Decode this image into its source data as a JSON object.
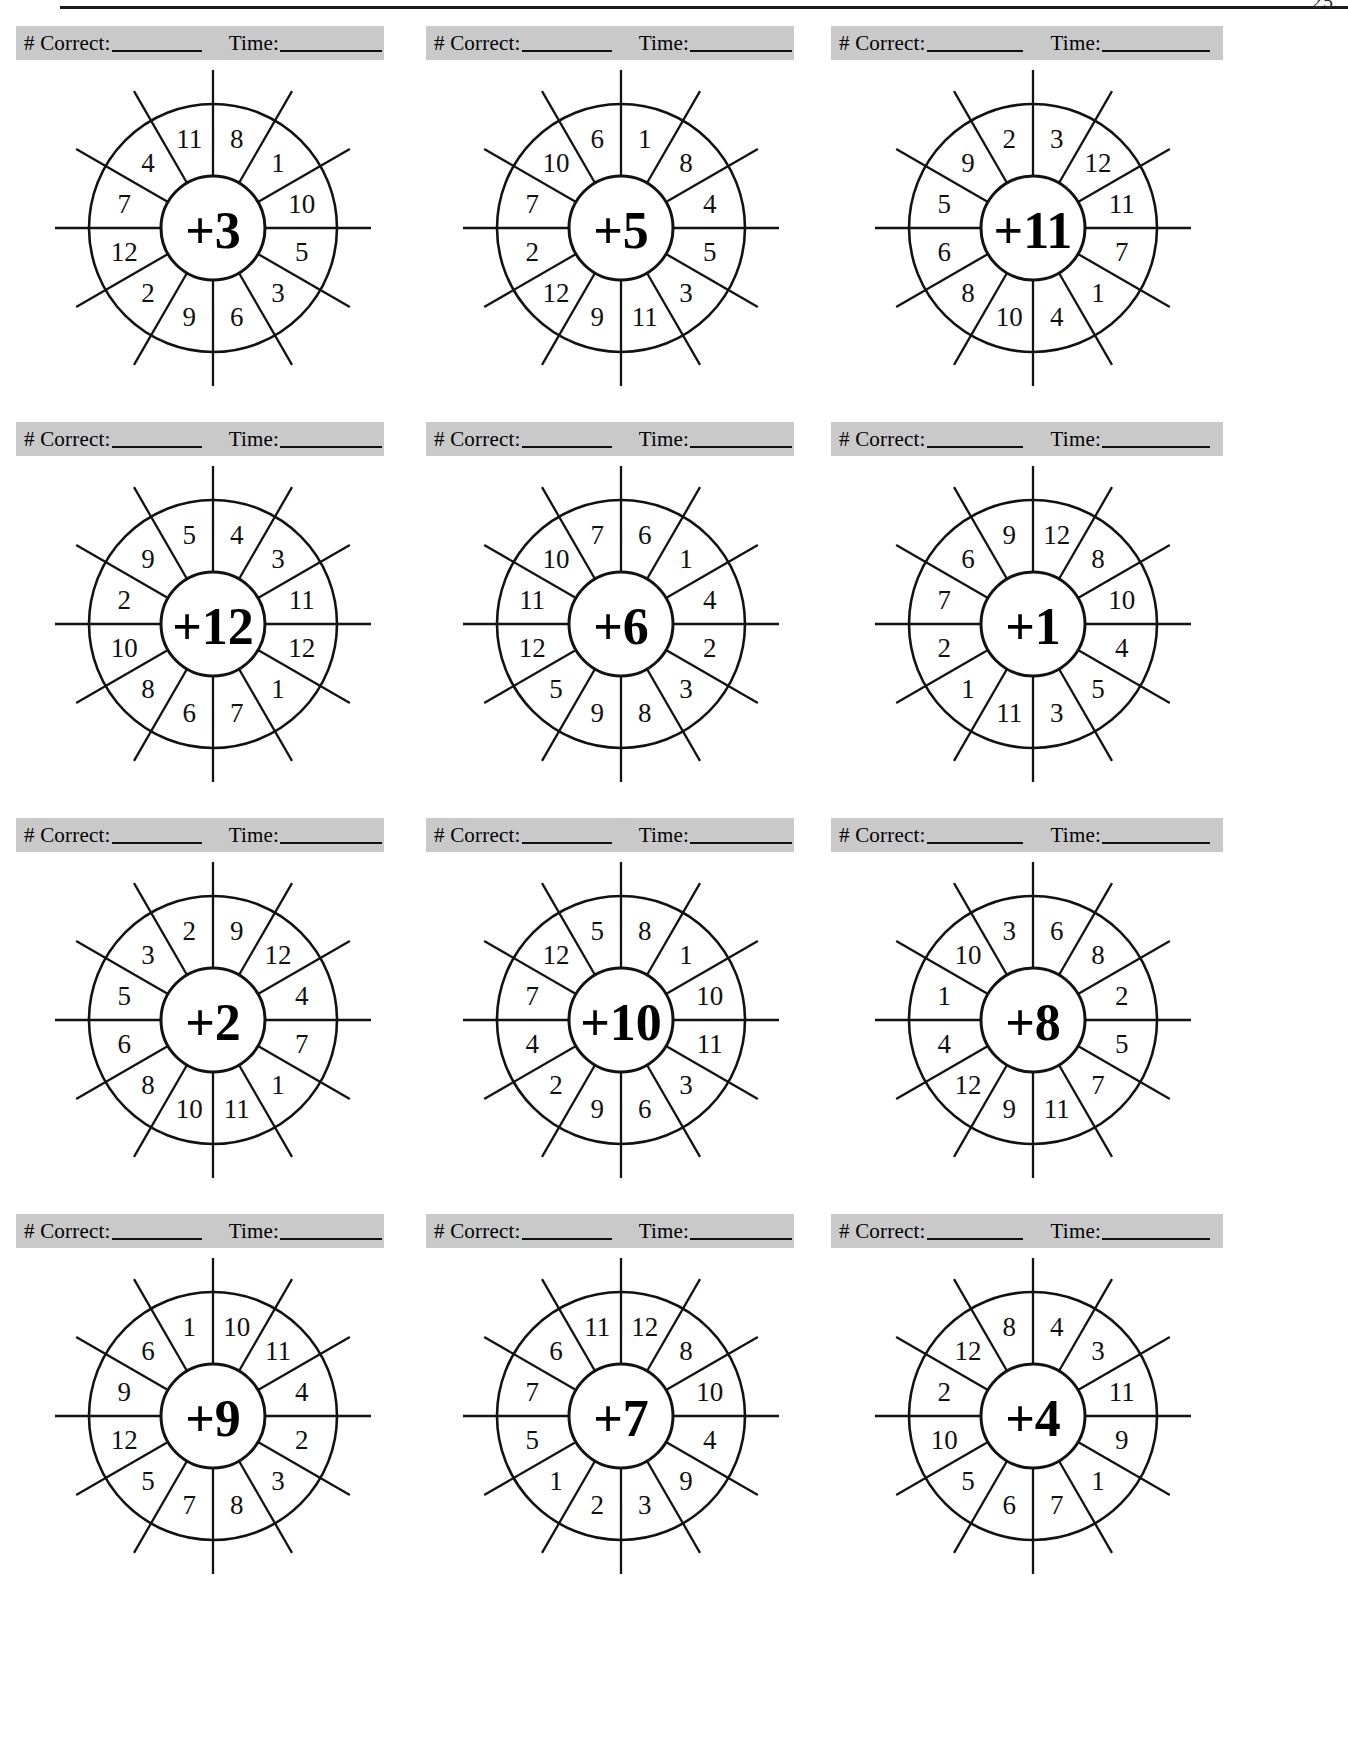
{
  "page": {
    "page_number": "25",
    "top_rule": true
  },
  "score_bar": {
    "correct_label": "# Correct:",
    "time_label": "Time:",
    "correct_blank": "",
    "time_blank": ""
  },
  "worksheet": {
    "columns": 3,
    "rows": 4,
    "sector_count": 12,
    "bar_color": "#c9c9c9",
    "ink_color": "#121212"
  },
  "chart_data": {
    "type": "table",
    "wheels": [
      {
        "index": 1,
        "row": 1,
        "column": 1,
        "center": "+3",
        "operator": "+",
        "addend": 3,
        "outer_clockwise": [
          8,
          1,
          10,
          5,
          3,
          6,
          9,
          2,
          12,
          7,
          4,
          11
        ]
      },
      {
        "index": 2,
        "row": 1,
        "column": 2,
        "center": "+5",
        "operator": "+",
        "addend": 5,
        "outer_clockwise": [
          1,
          8,
          4,
          5,
          3,
          11,
          9,
          12,
          2,
          7,
          10,
          6
        ]
      },
      {
        "index": 3,
        "row": 1,
        "column": 3,
        "center": "+11",
        "operator": "+",
        "addend": 11,
        "outer_clockwise": [
          3,
          12,
          11,
          7,
          1,
          4,
          10,
          8,
          6,
          5,
          9,
          2
        ]
      },
      {
        "index": 4,
        "row": 2,
        "column": 1,
        "center": "+12",
        "operator": "+",
        "addend": 12,
        "outer_clockwise": [
          4,
          3,
          11,
          12,
          1,
          7,
          6,
          8,
          10,
          2,
          9,
          5
        ]
      },
      {
        "index": 5,
        "row": 2,
        "column": 2,
        "center": "+6",
        "operator": "+",
        "addend": 6,
        "outer_clockwise": [
          6,
          1,
          4,
          2,
          3,
          8,
          9,
          5,
          12,
          11,
          10,
          7
        ]
      },
      {
        "index": 6,
        "row": 2,
        "column": 3,
        "center": "+1",
        "operator": "+",
        "addend": 1,
        "outer_clockwise": [
          12,
          8,
          10,
          4,
          5,
          3,
          11,
          1,
          2,
          7,
          6,
          9
        ]
      },
      {
        "index": 7,
        "row": 3,
        "column": 1,
        "center": "+2",
        "operator": "+",
        "addend": 2,
        "outer_clockwise": [
          9,
          12,
          4,
          7,
          1,
          11,
          10,
          8,
          6,
          5,
          3,
          2
        ]
      },
      {
        "index": 8,
        "row": 3,
        "column": 2,
        "center": "+10",
        "operator": "+",
        "addend": 10,
        "outer_clockwise": [
          8,
          1,
          10,
          11,
          3,
          6,
          9,
          2,
          4,
          7,
          12,
          5
        ]
      },
      {
        "index": 9,
        "row": 3,
        "column": 3,
        "center": "+8",
        "operator": "+",
        "addend": 8,
        "outer_clockwise": [
          6,
          8,
          2,
          5,
          7,
          11,
          9,
          12,
          4,
          1,
          10,
          3
        ]
      },
      {
        "index": 10,
        "row": 4,
        "column": 1,
        "center": "+9",
        "operator": "+",
        "addend": 9,
        "outer_clockwise": [
          10,
          11,
          4,
          2,
          3,
          8,
          7,
          5,
          12,
          9,
          6,
          1
        ]
      },
      {
        "index": 11,
        "row": 4,
        "column": 2,
        "center": "+7",
        "operator": "+",
        "addend": 7,
        "outer_clockwise": [
          12,
          8,
          10,
          4,
          9,
          3,
          2,
          1,
          5,
          7,
          6,
          11
        ]
      },
      {
        "index": 12,
        "row": 4,
        "column": 3,
        "center": "+4",
        "operator": "+",
        "addend": 4,
        "outer_clockwise": [
          4,
          3,
          11,
          9,
          1,
          7,
          6,
          5,
          10,
          2,
          12,
          8
        ]
      }
    ]
  }
}
